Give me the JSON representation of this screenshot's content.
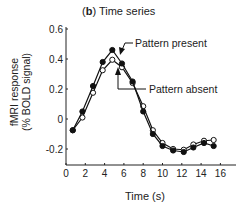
{
  "chart_data": {
    "type": "line",
    "panel_label": "b",
    "title": "Time series",
    "xlabel": "Time (s)",
    "ylabel_line1": "fMRI response",
    "ylabel_line2": "(% BOLD signal)",
    "xlim": [
      0,
      17.5
    ],
    "ylim": [
      -0.3,
      0.6
    ],
    "xticks": [
      0,
      2,
      4,
      6,
      8,
      10,
      12,
      14,
      16
    ],
    "yticks": [
      0.6,
      0.4,
      0.2,
      0,
      -0.2
    ],
    "ytick_labels": [
      "0.6",
      "0.4",
      "0.2",
      "0",
      "-0.2"
    ],
    "grid": false,
    "x": [
      0.7,
      1.7,
      2.8,
      3.8,
      4.8,
      5.8,
      6.9,
      8.0,
      9.0,
      10.0,
      11.1,
      12.2,
      13.2,
      14.3,
      15.3
    ],
    "series": [
      {
        "name": "Pattern present",
        "marker": "filled-circle",
        "values": [
          -0.075,
          0.05,
          0.22,
          0.38,
          0.46,
          0.37,
          0.25,
          0.05,
          -0.1,
          -0.18,
          -0.21,
          -0.22,
          -0.19,
          -0.16,
          -0.18
        ]
      },
      {
        "name": "Pattern absent",
        "marker": "open-circle",
        "values": [
          -0.075,
          0.01,
          0.175,
          0.325,
          0.395,
          0.345,
          0.24,
          0.085,
          -0.075,
          -0.16,
          -0.2,
          -0.205,
          -0.17,
          -0.145,
          -0.14
        ]
      }
    ],
    "annotations": [
      {
        "text": "Pattern present",
        "points_to": "Pattern present"
      },
      {
        "text": "Pattern absent",
        "points_to": "Pattern absent"
      }
    ]
  }
}
